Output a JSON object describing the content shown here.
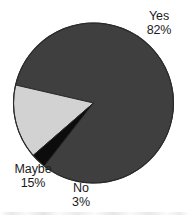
{
  "chart_data": {
    "type": "pie",
    "title": "",
    "subtitle": "",
    "xlabel": "",
    "ylabel": "",
    "legend_position": "none",
    "grid": false,
    "categories": [
      "Yes",
      "Maybe",
      "No"
    ],
    "values": [
      82,
      15,
      3
    ],
    "value_unit": "%",
    "slices": [
      {
        "label": "Yes",
        "value": 82,
        "value_text": "82%",
        "color": "#3f3f3f",
        "start_angle_deg": 193,
        "end_angle_deg": 488
      },
      {
        "label": "Maybe",
        "value": 15,
        "value_text": "15%",
        "color": "#d2d2d2",
        "start_angle_deg": 139,
        "end_angle_deg": 193
      },
      {
        "label": "No",
        "value": 3,
        "value_text": "3%",
        "color": "#0c0c0c",
        "start_angle_deg": 128,
        "end_angle_deg": 139
      }
    ],
    "annotations": [
      {
        "name": "yes",
        "label": "Yes",
        "value_text": "82%"
      },
      {
        "name": "maybe",
        "label": "Maybe",
        "value_text": "15%"
      },
      {
        "name": "no",
        "label": "No",
        "value_text": "3%"
      }
    ]
  },
  "geometry": {
    "center_x": 93.5,
    "center_y": 103,
    "radius": 80
  },
  "colors": {
    "yes": "#3f3f3f",
    "maybe": "#d2d2d2",
    "no": "#0c0c0c",
    "outline": "#2a2a2a",
    "background": "#ffffff",
    "text": "#1a1a1a"
  }
}
